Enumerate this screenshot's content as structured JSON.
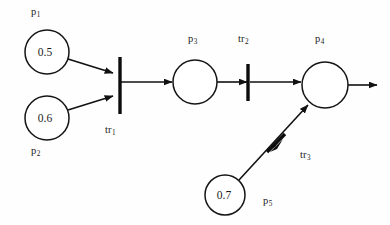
{
  "diagram": {
    "kind": "petri-net",
    "canvas": {
      "width": 390,
      "height": 225,
      "background": "#fefefe"
    },
    "stroke_color": "#111111",
    "places": [
      {
        "id": "p1",
        "label": "p",
        "subscript": "1",
        "value": "0.5",
        "cx": 47,
        "cy": 52,
        "r": 22,
        "label_x": 31,
        "label_y": 7
      },
      {
        "id": "p2",
        "label": "p",
        "subscript": "2",
        "value": "0.6",
        "cx": 47,
        "cy": 118,
        "r": 22,
        "label_x": 31,
        "label_y": 146
      },
      {
        "id": "p3",
        "label": "p",
        "subscript": "3",
        "value": "",
        "cx": 195,
        "cy": 82,
        "r": 22,
        "label_x": 188,
        "label_y": 34
      },
      {
        "id": "p4",
        "label": "p",
        "subscript": "4",
        "value": "",
        "cx": 325,
        "cy": 85,
        "r": 23,
        "label_x": 315,
        "label_y": 34
      },
      {
        "id": "p5",
        "label": "p",
        "subscript": "5",
        "value": "0.7",
        "cx": 225,
        "cy": 195,
        "r": 20,
        "label_x": 263,
        "label_y": 196
      }
    ],
    "transitions": [
      {
        "id": "tr1",
        "label": "tr",
        "subscript": "1",
        "x1": 120,
        "y1": 57,
        "x2": 120,
        "y2": 114,
        "label_x": 105,
        "label_y": 125
      },
      {
        "id": "tr2",
        "label": "tr",
        "subscript": "2",
        "x1": 248,
        "y1": 64,
        "x2": 248,
        "y2": 101,
        "label_x": 238,
        "label_y": 34
      },
      {
        "id": "tr3",
        "label": "tr",
        "subscript": "3",
        "x1": 268,
        "y1": 152,
        "x2": 283,
        "y2": 135,
        "label_x": 300,
        "label_y": 150
      }
    ],
    "arcs": [
      {
        "id": "arc-p1-tr1",
        "from": "p1",
        "to": "tr1",
        "x1": 68,
        "y1": 59,
        "x2": 115,
        "y2": 74
      },
      {
        "id": "arc-p2-tr1",
        "from": "p2",
        "to": "tr1",
        "x1": 68,
        "y1": 110,
        "x2": 115,
        "y2": 95
      },
      {
        "id": "arc-tr1-p3",
        "from": "tr1",
        "to": "p3",
        "x1": 121,
        "y1": 82,
        "x2": 171,
        "y2": 82
      },
      {
        "id": "arc-p3-tr2",
        "from": "p3",
        "to": "tr2",
        "x1": 217,
        "y1": 82,
        "x2": 245,
        "y2": 82
      },
      {
        "id": "arc-tr2-p4",
        "from": "tr2",
        "to": "p4",
        "x1": 250,
        "y1": 82,
        "x2": 300,
        "y2": 82
      },
      {
        "id": "arc-p5-tr3",
        "from": "p5",
        "to": "tr3",
        "x1": 240,
        "y1": 180,
        "x2": 306,
        "y2": 107
      },
      {
        "id": "arc-p4-out",
        "from": "p4",
        "to": "output",
        "x1": 348,
        "y1": 85,
        "x2": 378,
        "y2": 85
      }
    ]
  }
}
